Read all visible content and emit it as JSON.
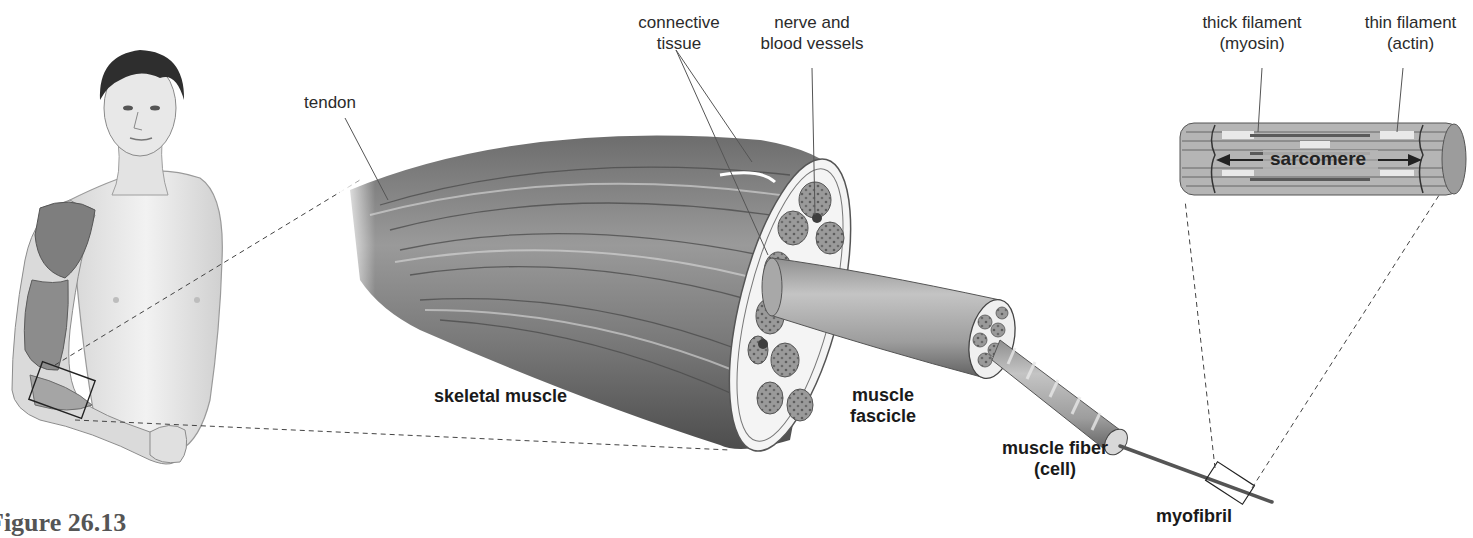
{
  "figure": {
    "caption": "Figure 26.13",
    "labels": {
      "tendon": "tendon",
      "connective_tissue": [
        "connective",
        "tissue"
      ],
      "nerve_blood_vessels": [
        "nerve and",
        "blood vessels"
      ],
      "thick_filament": [
        "thick filament",
        "(myosin)"
      ],
      "thin_filament": [
        "thin filament",
        "(actin)"
      ],
      "sarcomere": "sarcomere",
      "skeletal_muscle": "skeletal muscle",
      "muscle_fascicle": [
        "muscle",
        "fascicle"
      ],
      "muscle_fiber": [
        "muscle fiber",
        "(cell)"
      ],
      "myofibril": "myofibril"
    },
    "colors": {
      "ink": "#2b2b2b",
      "muscle_dark": "#5a5a5a",
      "muscle_mid": "#8a8a8a",
      "muscle_light": "#d0d0d0",
      "skin": "#e6e6e6"
    }
  }
}
